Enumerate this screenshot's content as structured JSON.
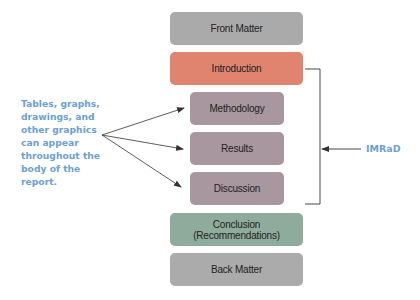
{
  "diagram": {
    "sections": [
      {
        "id": "front-matter",
        "label": "Front Matter",
        "color": "#aaaaaa"
      },
      {
        "id": "introduction",
        "label": "Introduction",
        "color": "#e0836f"
      },
      {
        "id": "methodology",
        "label": "Methodology",
        "color": "#a9979f"
      },
      {
        "id": "results",
        "label": "Results",
        "color": "#a9979f"
      },
      {
        "id": "discussion",
        "label": "Discussion",
        "color": "#a9979f"
      },
      {
        "id": "conclusion",
        "label": "Conclusion",
        "sublabel": "(Recommendations)",
        "color": "#8fab9c"
      },
      {
        "id": "back-matter",
        "label": "Back Matter",
        "color": "#ababab"
      }
    ],
    "side_note": {
      "lines": [
        "Tables, graphs,",
        "drawings, and",
        "other graphics",
        "can appear",
        "throughout the",
        "body of the",
        "report."
      ],
      "color": "#6d9fd2"
    },
    "bracket_label": {
      "text": "IMRaD",
      "color": "#6d9fd2"
    },
    "line_color": "#333333"
  }
}
